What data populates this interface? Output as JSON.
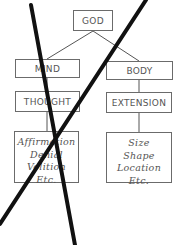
{
  "diagram": {
    "root": {
      "label": "GOD"
    },
    "branches": [
      {
        "label": "MIND",
        "attribute": "THOUGHT",
        "modes": [
          "Affirmation",
          "Denial",
          "Volition",
          "Etc."
        ]
      },
      {
        "label": "BODY",
        "attribute": "EXTENSION",
        "modes": [
          "Size",
          "Shape",
          "Location",
          "Etc."
        ]
      }
    ],
    "annotation": "Large X crossing out the Mind branch",
    "colors": {
      "box_border": "#6b6b6b",
      "text": "#555555",
      "cross_out": "#111111"
    }
  }
}
